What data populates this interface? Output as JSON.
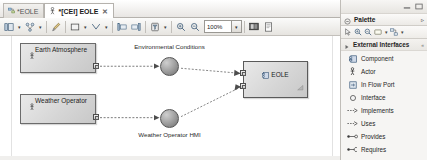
{
  "editor": {
    "tabs": [
      {
        "label": "*EOLE",
        "icon": "diagram-icon",
        "active": false,
        "closable": false
      },
      {
        "label": "*[CEI] EOLE",
        "icon": "actor-diagram-icon",
        "active": true,
        "closable": true,
        "close_glyph": "✕"
      }
    ],
    "toolbar": {
      "buttons": [
        {
          "name": "select-tool-button",
          "icon": "select-icon",
          "has_caret": true
        },
        {
          "name": "layout-tool-button",
          "icon": "layout-icon",
          "has_caret": true
        },
        {
          "name": "format-painter-button",
          "icon": "paintbrush-icon",
          "has_caret": false
        },
        {
          "name": "shape-fill-button",
          "icon": "square-icon",
          "has_caret": true
        },
        {
          "name": "line-style-button",
          "icon": "line-style-icon",
          "has_caret": true
        },
        {
          "name": "align-left-button",
          "icon": "align-left-icon",
          "has_caret": false
        },
        {
          "name": "align-right-button",
          "icon": "align-right-icon",
          "has_caret": false
        },
        {
          "name": "filter-button",
          "icon": "filter-icon",
          "has_caret": true
        },
        {
          "name": "zoom-in-button",
          "icon": "zoom-in-icon",
          "has_caret": false
        },
        {
          "name": "zoom-out-button",
          "icon": "zoom-out-icon",
          "has_caret": false
        }
      ],
      "zoom_value": "100%",
      "zoom_caret": "▾",
      "right_buttons": [
        {
          "name": "image-export-button",
          "icon": "image-icon"
        },
        {
          "name": "print-preview-button",
          "icon": "page-icon"
        }
      ]
    },
    "diagram": {
      "nodes": [
        {
          "id": "earth-atmosphere",
          "label": "Earth Atmosphere",
          "icon": "actor-icon",
          "x": 20,
          "y": 7,
          "w": 76,
          "h": 30
        },
        {
          "id": "weather-operator",
          "label": "Weather Operator",
          "icon": "actor-icon",
          "x": 20,
          "y": 58,
          "w": 76,
          "h": 30
        },
        {
          "id": "eole-component",
          "label": "EOLE",
          "icon": "component-icon",
          "x": 243,
          "y": 25,
          "w": 65,
          "h": 37
        }
      ],
      "interfaces": [
        {
          "id": "environmental-conditions",
          "label": "Environmental Conditions",
          "cx": 169,
          "cy": 30
        },
        {
          "id": "weather-operator-hmi",
          "label": "Weather Operator HMI",
          "cx": 169,
          "cy": 83
        }
      ],
      "ports": [
        {
          "id": "port-earth-out",
          "x": 93,
          "y": 27
        },
        {
          "id": "port-weather-out",
          "x": 93,
          "y": 78
        },
        {
          "id": "port-eole-in-1",
          "x": 240,
          "y": 34
        },
        {
          "id": "port-eole-in-2",
          "x": 240,
          "y": 47
        }
      ]
    }
  },
  "palette": {
    "window_buttons": [
      {
        "name": "minimize-button",
        "icon": "minimize-icon"
      },
      {
        "name": "maximize-button",
        "icon": "maximize-icon"
      }
    ],
    "title": "Palette",
    "menu_glyph": "▹",
    "tools": [
      {
        "name": "palette-select-tool",
        "icon": "pointer-icon",
        "has_caret": false
      },
      {
        "name": "palette-zoom-in-tool",
        "icon": "zoom-in-icon",
        "has_caret": false
      },
      {
        "name": "palette-zoom-out-tool",
        "icon": "zoom-out-icon",
        "has_caret": false
      },
      {
        "name": "palette-note-tool",
        "icon": "note-icon",
        "has_caret": true
      },
      {
        "name": "palette-connector-tool",
        "icon": "connector-icon",
        "has_caret": true
      }
    ],
    "group": {
      "title": "External Interfaces",
      "count": "«"
    },
    "items": [
      {
        "label": "Component",
        "icon": "component-icon"
      },
      {
        "label": "Actor",
        "icon": "actor-icon"
      },
      {
        "label": "In Flow Port",
        "icon": "flow-port-icon"
      },
      {
        "label": "Interface",
        "icon": "interface-icon"
      },
      {
        "label": "Implements",
        "icon": "implements-arrow-icon"
      },
      {
        "label": "Uses",
        "icon": "uses-arrow-icon"
      },
      {
        "label": "Provides",
        "icon": "provides-ball-icon"
      },
      {
        "label": "Requires",
        "icon": "requires-socket-icon"
      }
    ]
  },
  "colors": {
    "node_fill": "#d6d6d6",
    "node_border": "#6b6b6b",
    "canvas_bg": "#ffffff",
    "panel_bg": "#f6f5f3"
  }
}
